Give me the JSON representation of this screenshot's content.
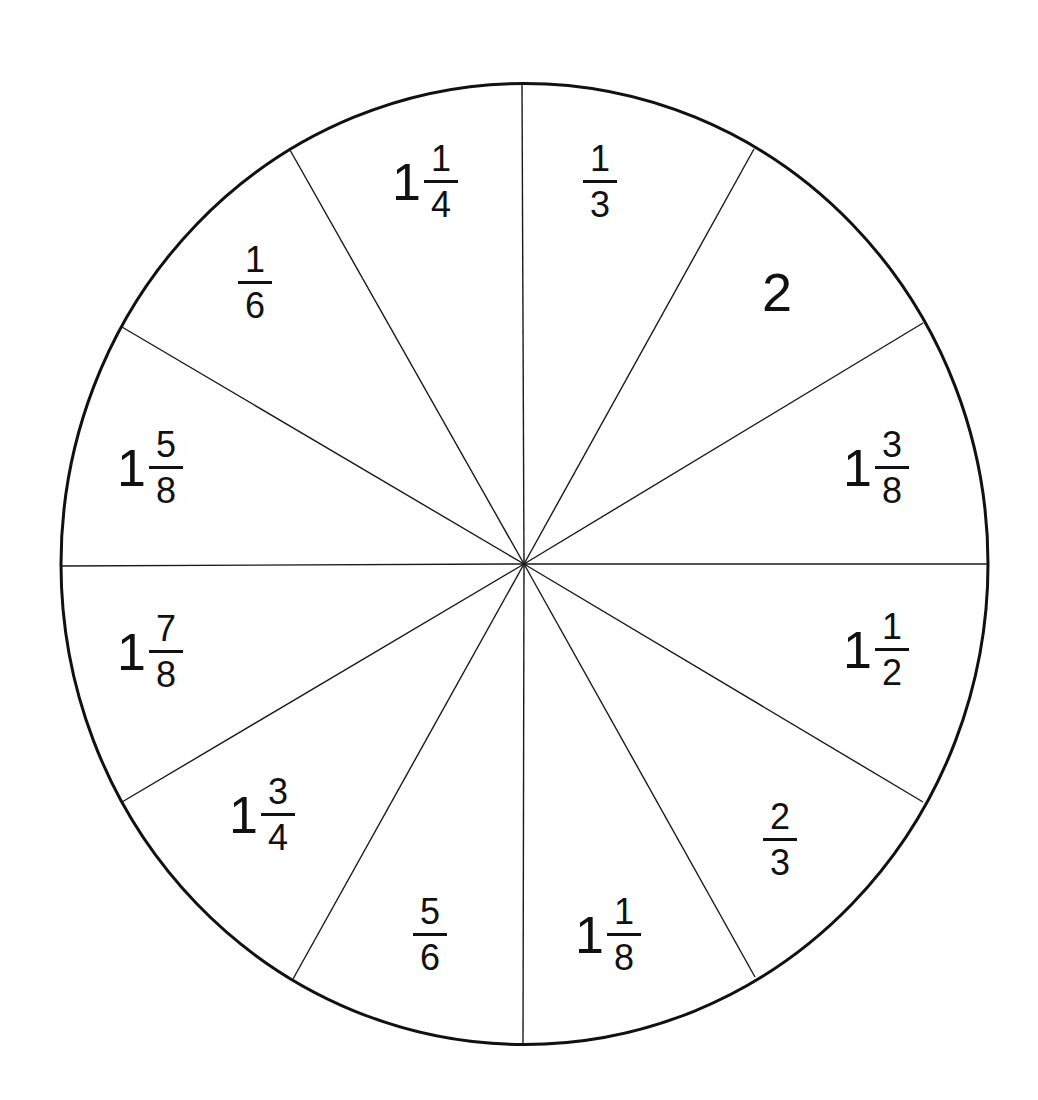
{
  "diagram": {
    "type": "fraction-wheel",
    "shape": "circle divided into 12 equal sectors",
    "colors": {
      "line": "#111111",
      "background": "#ffffff"
    },
    "sectors": [
      {
        "id": "s1",
        "whole": "",
        "num": "1",
        "den": "3",
        "label_text": "1/3",
        "x": 600,
        "y": 182
      },
      {
        "id": "s2",
        "whole": "2",
        "num": "",
        "den": "",
        "label_text": "2",
        "x": 777,
        "y": 292
      },
      {
        "id": "s3",
        "whole": "1",
        "num": "3",
        "den": "8",
        "label_text": "1 3/8",
        "x": 876,
        "y": 468
      },
      {
        "id": "s4",
        "whole": "1",
        "num": "1",
        "den": "2",
        "label_text": "1 1/2",
        "x": 876,
        "y": 650
      },
      {
        "id": "s5",
        "whole": "",
        "num": "2",
        "den": "3",
        "label_text": "2/3",
        "x": 780,
        "y": 840
      },
      {
        "id": "s6",
        "whole": "1",
        "num": "1",
        "den": "8",
        "label_text": "1 1/8",
        "x": 608,
        "y": 935
      },
      {
        "id": "s7",
        "whole": "",
        "num": "5",
        "den": "6",
        "label_text": "5/6",
        "x": 430,
        "y": 935
      },
      {
        "id": "s8",
        "whole": "1",
        "num": "3",
        "den": "4",
        "label_text": "1 3/4",
        "x": 262,
        "y": 815
      },
      {
        "id": "s9",
        "whole": "1",
        "num": "7",
        "den": "8",
        "label_text": "1 7/8",
        "x": 150,
        "y": 652
      },
      {
        "id": "s10",
        "whole": "1",
        "num": "5",
        "den": "8",
        "label_text": "1 5/8",
        "x": 150,
        "y": 468
      },
      {
        "id": "s11",
        "whole": "",
        "num": "1",
        "den": "6",
        "label_text": "1/6",
        "x": 255,
        "y": 283
      },
      {
        "id": "s12",
        "whole": "1",
        "num": "1",
        "den": "4",
        "label_text": "1 1/4",
        "x": 425,
        "y": 182
      }
    ]
  }
}
